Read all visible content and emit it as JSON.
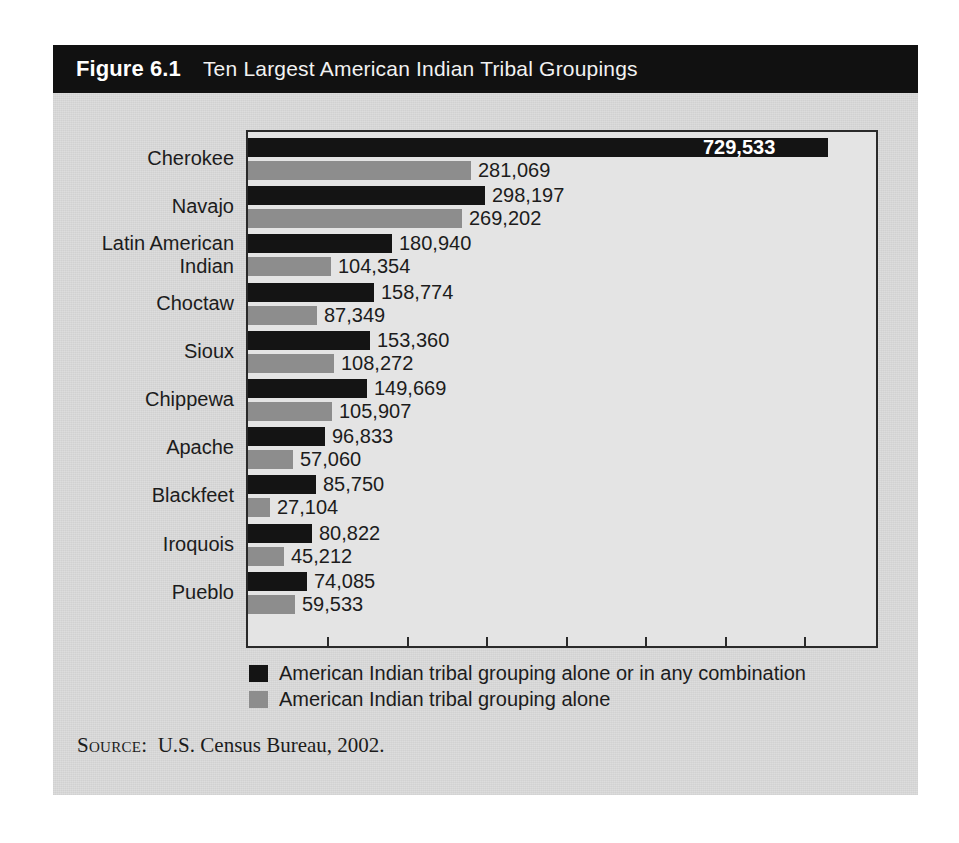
{
  "figure": {
    "number": "Figure 6.1",
    "title": "Ten Largest American Indian Tribal Groupings",
    "source_label": "Source:",
    "source_text": "U.S. Census Bureau, 2002."
  },
  "colors": {
    "header_bg": "#111111",
    "card_bg": "#dcdcdc",
    "plot_bg": "#e4e4e4",
    "series_combination": "#141414",
    "series_alone": "#8d8d8d",
    "text": "#1c1c1c",
    "inside_label": "#ffffff"
  },
  "legend": {
    "position": "below-plot",
    "items": [
      {
        "swatch": "dark",
        "label": "American Indian tribal grouping alone or in any combination"
      },
      {
        "swatch": "gray",
        "label": "American Indian tribal grouping alone"
      }
    ]
  },
  "chart_data": {
    "type": "bar",
    "orientation": "horizontal",
    "title": "Ten Largest American Indian Tribal Groupings",
    "xlabel": "",
    "ylabel": "",
    "xlim": [
      0,
      780000
    ],
    "grid": false,
    "tick_count": 7,
    "tick_interval": 100000,
    "tick_labels": [],
    "legend_position": "bottom-left",
    "categories": [
      "Cherokee",
      "Navajo",
      "Latin American Indian",
      "Choctaw",
      "Sioux",
      "Chippewa",
      "Apache",
      "Blackfeet",
      "Iroquois",
      "Pueblo"
    ],
    "series": [
      {
        "name": "American Indian tribal grouping alone or in any combination",
        "color": "#141414",
        "values": [
          729533,
          298197,
          180940,
          158774,
          153360,
          149669,
          96833,
          85750,
          80822,
          74085
        ],
        "labels": [
          "729,533",
          "298,197",
          "180,940",
          "158,774",
          "153,360",
          "149,669",
          "96,833",
          "85,750",
          "80,822",
          "74,085"
        ]
      },
      {
        "name": "American Indian tribal grouping alone",
        "color": "#8d8d8d",
        "values": [
          281069,
          269202,
          104354,
          87349,
          108272,
          105907,
          57060,
          27104,
          45212,
          59533
        ],
        "labels": [
          "281,069",
          "269,202",
          "104,354",
          "87,349",
          "108,272",
          "105,907",
          "57,060",
          "27,104",
          "45,212",
          "59,533"
        ]
      }
    ]
  }
}
